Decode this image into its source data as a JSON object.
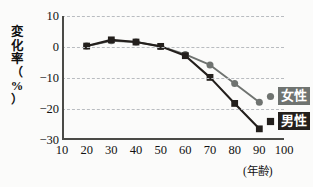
{
  "chart_data": {
    "type": "line",
    "title": "",
    "xlabel": "(年齢)",
    "ylabel": "変化率（%）",
    "ylabel_chars": [
      "変",
      "化",
      "率",
      "（",
      "%",
      "）"
    ],
    "x": [
      20,
      30,
      40,
      50,
      60,
      70,
      80,
      90
    ],
    "xlim": [
      10,
      100
    ],
    "ylim": [
      -30,
      10
    ],
    "xticks": [
      10,
      20,
      30,
      40,
      50,
      60,
      70,
      80,
      90,
      100
    ],
    "yticks": [
      10,
      0,
      -10,
      -20,
      -30
    ],
    "ytick_labels": [
      "10",
      "0",
      "−10",
      "−20",
      "−30"
    ],
    "grid": "horizontal-dashed",
    "legend_position": "right-middle",
    "series": [
      {
        "name": "女性",
        "color": "#6f7370",
        "marker": "circle",
        "values": [
          0.3,
          2.0,
          1.6,
          0.2,
          -2.4,
          -5.8,
          -11.8,
          -17.8
        ]
      },
      {
        "name": "男性",
        "color": "#231f1c",
        "marker": "square",
        "values": [
          0.3,
          2.3,
          1.6,
          0.2,
          -2.8,
          -9.8,
          -18.2,
          -26.4
        ]
      }
    ]
  },
  "legend": {
    "female": {
      "label": "女性",
      "color": "#6f7370"
    },
    "male": {
      "label": "男性",
      "color": "#231f1c"
    }
  },
  "axes": {
    "x_axis_title": "(年齢)",
    "y_axis_title": "変化率（%）"
  }
}
